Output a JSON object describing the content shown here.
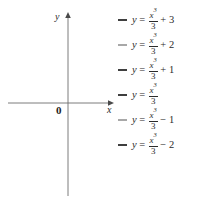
{
  "figure": {
    "axes": {
      "y_label": "y",
      "x_label": "x",
      "origin_label": "0"
    }
  },
  "legend": {
    "entries": [
      {
        "lhs": "y",
        "eq": "=",
        "num": "x",
        "exp": "3",
        "den": "3",
        "term": "+ 3",
        "color": "#3f3f3f"
      },
      {
        "lhs": "y",
        "eq": "=",
        "num": "x",
        "exp": "3",
        "den": "3",
        "term": "+ 2",
        "color": "#a8a8a8"
      },
      {
        "lhs": "y",
        "eq": "=",
        "num": "x",
        "exp": "3",
        "den": "3",
        "term": "+ 1",
        "color": "#3f3f3f"
      },
      {
        "lhs": "y",
        "eq": "=",
        "num": "x",
        "exp": "3",
        "den": "3",
        "term": "",
        "color": "#3f3f3f"
      },
      {
        "lhs": "y",
        "eq": "=",
        "num": "x",
        "exp": "3",
        "den": "3",
        "term": "− 1",
        "color": "#a8a8a8"
      },
      {
        "lhs": "y",
        "eq": "=",
        "num": "x",
        "exp": "3",
        "den": "3",
        "term": "− 2",
        "color": "#3f3f3f"
      }
    ]
  },
  "chart_data": {
    "type": "line",
    "title": "",
    "xlabel": "x",
    "ylabel": "y",
    "xlim": [
      -3.4,
      3.4
    ],
    "ylim": [
      -6.2,
      6.2
    ],
    "grid": false,
    "legend_position": "right",
    "annotations": [
      "0"
    ],
    "function_family": "y = x^3/3 + C",
    "series": [
      {
        "name": "y = x^3/3 + 3",
        "C": 3,
        "color": "#3f3f3f"
      },
      {
        "name": "y = x^3/3 + 2",
        "C": 2,
        "color": "#a8a8a8"
      },
      {
        "name": "y = x^3/3 + 1",
        "C": 1,
        "color": "#3f3f3f"
      },
      {
        "name": "y = x^3/3",
        "C": 0,
        "color": "#3f3f3f"
      },
      {
        "name": "y = x^3/3 - 1",
        "C": -1,
        "color": "#a8a8a8"
      },
      {
        "name": "y = x^3/3 - 2",
        "C": -2,
        "color": "#3f3f3f"
      }
    ]
  }
}
